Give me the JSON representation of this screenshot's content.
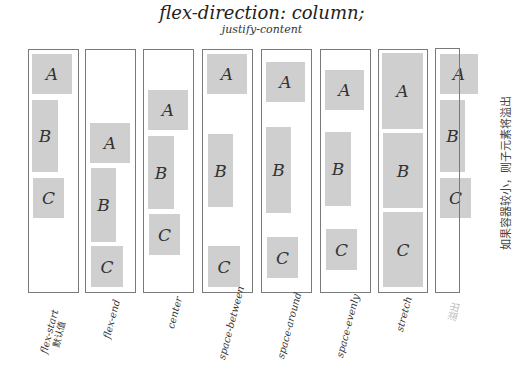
{
  "title": "flex-direction: column;",
  "subtitle": "justify-content",
  "note": "如果容器较小，则子元素将溢出",
  "colors": {
    "box_fill": "#cfcfcf",
    "border": "#7a7a7a",
    "faded_label": "#bbbbbb"
  },
  "containers": [
    {
      "label": "flex-start",
      "sublabel": "默认值",
      "boxes": [
        "A",
        "B",
        "C"
      ]
    },
    {
      "label": "flex-end",
      "boxes": [
        "A",
        "B",
        "C"
      ]
    },
    {
      "label": "center",
      "boxes": [
        "A",
        "B",
        "C"
      ]
    },
    {
      "label": "space-between",
      "boxes": [
        "A",
        "B",
        "C"
      ]
    },
    {
      "label": "space-around",
      "boxes": [
        "A",
        "B",
        "C"
      ]
    },
    {
      "label": "space-evenly",
      "boxes": [
        "A",
        "B",
        "C"
      ]
    },
    {
      "label": "stretch",
      "boxes": [
        "A",
        "B",
        "C"
      ]
    },
    {
      "label": "溢出",
      "boxes": [
        "A",
        "B",
        "C"
      ]
    }
  ]
}
